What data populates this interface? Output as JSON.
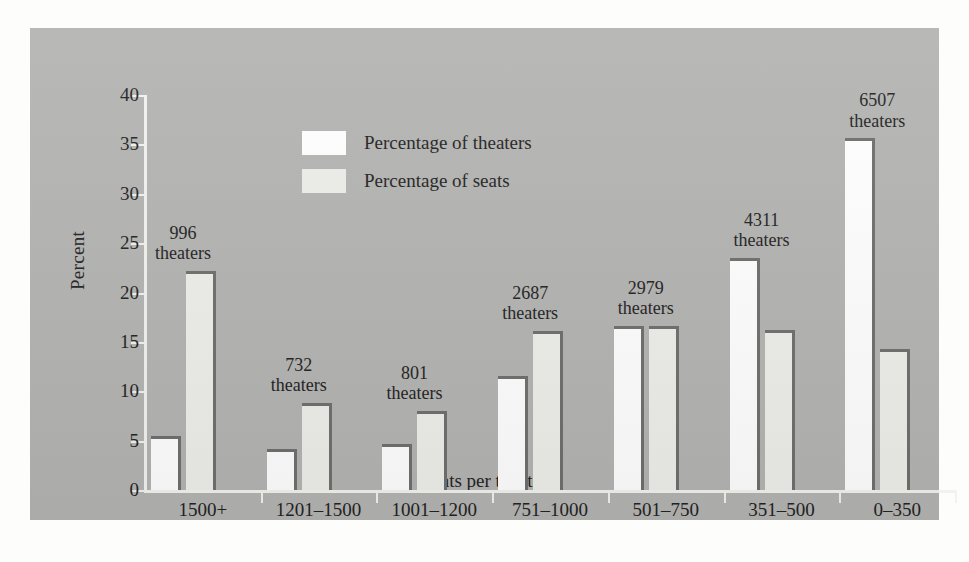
{
  "chart_data": {
    "type": "bar",
    "title": "",
    "xlabel": "Seats per theater",
    "ylabel": "Percent",
    "ylim": [
      0,
      40
    ],
    "yticks": [
      0,
      5,
      10,
      15,
      20,
      25,
      30,
      35,
      40
    ],
    "grid": false,
    "legend_position": "upper-left-inside",
    "categories": [
      "1500+",
      "1201–1500",
      "1001–1200",
      "751–1000",
      "501–750",
      "351–500",
      "0–350"
    ],
    "series": [
      {
        "name": "Percentage of theaters",
        "color": "#ffffff",
        "values": [
          5.5,
          4.2,
          4.7,
          11.5,
          16.6,
          23.5,
          35.6
        ]
      },
      {
        "name": "Percentage of seats",
        "color": "#eeeeea",
        "values": [
          22.2,
          8.8,
          8.0,
          16.1,
          16.6,
          16.2,
          14.3
        ]
      }
    ],
    "annotations": [
      {
        "count": "996",
        "unit": "theaters"
      },
      {
        "count": "732",
        "unit": "theaters"
      },
      {
        "count": "801",
        "unit": "theaters"
      },
      {
        "count": "2687",
        "unit": "theaters"
      },
      {
        "count": "2979",
        "unit": "theaters"
      },
      {
        "count": "4311",
        "unit": "theaters"
      },
      {
        "count": "6507",
        "unit": "theaters"
      }
    ]
  },
  "colors": {
    "panel_background": "#b4b4b2",
    "figure_background": "#fdfdfc",
    "axis_line": "#f2f2ee",
    "bar_edge": "#6f6f6d",
    "text": "#232323"
  }
}
